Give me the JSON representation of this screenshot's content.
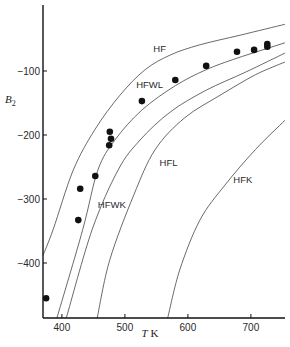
{
  "chart_data": {
    "type": "scatter",
    "title": "",
    "xlabel": "T K",
    "ylabel": "B2",
    "xlim": [
      370,
      755
    ],
    "ylim": [
      -486,
      0
    ],
    "grid": false,
    "legend": "none (curves labelled inline)",
    "x_ticks": [
      400,
      500,
      600,
      700
    ],
    "y_ticks": [
      -100,
      -200,
      -300,
      -400
    ],
    "x_tick_labels": [
      "400",
      "500",
      "600",
      "700"
    ],
    "y_tick_labels": [
      "−100",
      "−200",
      "−300",
      "−400"
    ],
    "points": [
      {
        "T": 375,
        "B": -455
      },
      {
        "T": 426,
        "B": -333
      },
      {
        "T": 429,
        "B": -284
      },
      {
        "T": 453,
        "B": -264
      },
      {
        "T": 475,
        "B": -216
      },
      {
        "T": 478,
        "B": -206
      },
      {
        "T": 476,
        "B": -195
      },
      {
        "T": 527,
        "B": -147
      },
      {
        "T": 580,
        "B": -114
      },
      {
        "T": 629,
        "B": -92
      },
      {
        "T": 678,
        "B": -70
      },
      {
        "T": 705,
        "B": -67
      },
      {
        "T": 726,
        "B": -62
      },
      {
        "T": 726,
        "B": -58
      }
    ],
    "series": [
      {
        "name": "HF",
        "label_pos": {
          "T": 545,
          "B": -70
        },
        "points": [
          [
            370,
            -388
          ],
          [
            386,
            -348
          ],
          [
            418,
            -255
          ],
          [
            452,
            -192
          ],
          [
            492,
            -138
          ],
          [
            532,
            -98
          ],
          [
            572,
            -75
          ],
          [
            619,
            -59
          ],
          [
            683,
            -44
          ],
          [
            754,
            -27
          ]
        ]
      },
      {
        "name": "HFWL",
        "label_pos": {
          "T": 518,
          "B": -127
        },
        "points": [
          [
            392,
            -486
          ],
          [
            433,
            -348
          ],
          [
            457,
            -255
          ],
          [
            484,
            -208
          ],
          [
            527,
            -161
          ],
          [
            580,
            -123
          ],
          [
            629,
            -98
          ],
          [
            678,
            -80
          ],
          [
            754,
            -56
          ]
        ]
      },
      {
        "name": "HFWK",
        "label_pos": {
          "T": 457,
          "B": -314
        },
        "points": [
          [
            407,
            -486
          ],
          [
            448,
            -348
          ],
          [
            489,
            -255
          ],
          [
            524,
            -208
          ],
          [
            572,
            -164
          ],
          [
            629,
            -130
          ],
          [
            691,
            -102
          ],
          [
            754,
            -72
          ]
        ]
      },
      {
        "name": "HFL",
        "label_pos": {
          "T": 555,
          "B": -248
        },
        "points": [
          [
            456,
            -486
          ],
          [
            476,
            -395
          ],
          [
            514,
            -294
          ],
          [
            548,
            -223
          ],
          [
            595,
            -173
          ],
          [
            651,
            -138
          ],
          [
            707,
            -106
          ],
          [
            754,
            -86
          ]
        ]
      },
      {
        "name": "HFK",
        "label_pos": {
          "T": 672,
          "B": -275
        },
        "points": [
          [
            568,
            -486
          ],
          [
            587,
            -411
          ],
          [
            619,
            -333
          ],
          [
            659,
            -278
          ],
          [
            707,
            -223
          ],
          [
            754,
            -177
          ]
        ]
      }
    ]
  },
  "axes": {
    "x_title_italic": "T",
    "x_title_unit": " K",
    "y_title_main": "B",
    "y_title_sub": "2"
  }
}
